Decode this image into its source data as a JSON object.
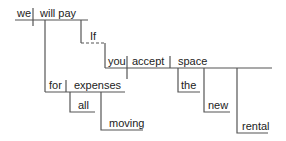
{
  "diagram": {
    "type": "sentence-diagram",
    "sentence": "If you accept the new rental space, we will pay for all moving expenses.",
    "colors": {
      "line": "#555555",
      "text": "#222222",
      "background": "#ffffff"
    },
    "words": {
      "subject": "we",
      "verb": "will pay",
      "conjunction": "If",
      "clause_subject": "you",
      "clause_verb": "accept",
      "clause_object": "space",
      "mod_the": "the",
      "mod_new": "new",
      "mod_rental": "rental",
      "preposition": "for",
      "prep_object": "expenses",
      "mod_all": "all",
      "mod_moving": "moving"
    }
  }
}
